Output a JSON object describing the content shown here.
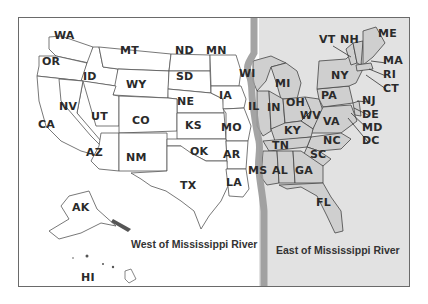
{
  "map": {
    "title": "United States divided by the Mississippi River",
    "colors": {
      "west_fill": "#ffffff",
      "east_fill": "#e2e2e2",
      "east_state_fill": "#cfcfcf",
      "river": "#9a9a9a",
      "border": "#555555",
      "frame": "#6a6a6a"
    },
    "regions": {
      "west": {
        "caption": "West of Mississippi River"
      },
      "east": {
        "caption": "East of Mississippi River"
      }
    },
    "states_west": [
      {
        "code": "WA",
        "x": 62,
        "y": 36
      },
      {
        "code": "OR",
        "x": 50,
        "y": 62
      },
      {
        "code": "ID",
        "x": 91,
        "y": 77
      },
      {
        "code": "MT",
        "x": 128,
        "y": 51
      },
      {
        "code": "WY",
        "x": 134,
        "y": 85
      },
      {
        "code": "ND",
        "x": 183,
        "y": 51
      },
      {
        "code": "SD",
        "x": 184,
        "y": 77
      },
      {
        "code": "MN",
        "x": 214,
        "y": 51
      },
      {
        "code": "NE",
        "x": 185,
        "y": 102
      },
      {
        "code": "IA",
        "x": 227,
        "y": 96
      },
      {
        "code": "NV",
        "x": 67,
        "y": 107
      },
      {
        "code": "UT",
        "x": 99,
        "y": 117
      },
      {
        "code": "CO",
        "x": 140,
        "y": 121
      },
      {
        "code": "KS",
        "x": 193,
        "y": 126
      },
      {
        "code": "MO",
        "x": 229,
        "y": 128
      },
      {
        "code": "CA",
        "x": 46,
        "y": 125
      },
      {
        "code": "AZ",
        "x": 94,
        "y": 153
      },
      {
        "code": "NM",
        "x": 134,
        "y": 158
      },
      {
        "code": "OK",
        "x": 198,
        "y": 152
      },
      {
        "code": "AR",
        "x": 231,
        "y": 155
      },
      {
        "code": "TX",
        "x": 188,
        "y": 186
      },
      {
        "code": "LA",
        "x": 234,
        "y": 183
      },
      {
        "code": "AK",
        "x": 80,
        "y": 208
      },
      {
        "code": "HI",
        "x": 89,
        "y": 278
      }
    ],
    "states_east": [
      {
        "code": "WI",
        "x": 247,
        "y": 74
      },
      {
        "code": "MI",
        "x": 283,
        "y": 84
      },
      {
        "code": "IL",
        "x": 256,
        "y": 107
      },
      {
        "code": "IN",
        "x": 275,
        "y": 108
      },
      {
        "code": "OH",
        "x": 294,
        "y": 103
      },
      {
        "code": "WV",
        "x": 308,
        "y": 116
      },
      {
        "code": "PA",
        "x": 329,
        "y": 96
      },
      {
        "code": "NY",
        "x": 339,
        "y": 76
      },
      {
        "code": "VT",
        "x": 327,
        "y": 40
      },
      {
        "code": "NH",
        "x": 348,
        "y": 40
      },
      {
        "code": "ME",
        "x": 386,
        "y": 34
      },
      {
        "code": "MA",
        "x": 391,
        "y": 61
      },
      {
        "code": "RI",
        "x": 391,
        "y": 75
      },
      {
        "code": "CT",
        "x": 391,
        "y": 89
      },
      {
        "code": "NJ",
        "x": 370,
        "y": 101
      },
      {
        "code": "DE",
        "x": 370,
        "y": 115
      },
      {
        "code": "MD",
        "x": 370,
        "y": 128
      },
      {
        "code": "DC",
        "x": 370,
        "y": 141
      },
      {
        "code": "VA",
        "x": 331,
        "y": 122
      },
      {
        "code": "KY",
        "x": 292,
        "y": 131
      },
      {
        "code": "NC",
        "x": 331,
        "y": 141
      },
      {
        "code": "TN",
        "x": 280,
        "y": 146
      },
      {
        "code": "SC",
        "x": 318,
        "y": 155
      },
      {
        "code": "MS",
        "x": 256,
        "y": 171
      },
      {
        "code": "AL",
        "x": 280,
        "y": 171
      },
      {
        "code": "GA",
        "x": 303,
        "y": 171
      },
      {
        "code": "FL",
        "x": 324,
        "y": 203
      }
    ],
    "captions": {
      "west": {
        "x": 131,
        "y": 244
      },
      "east": {
        "x": 276,
        "y": 250
      }
    }
  }
}
